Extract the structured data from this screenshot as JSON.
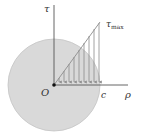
{
  "diagram": {
    "labels": {
      "tau_axis": "τ",
      "tau_max": "τ",
      "tau_max_sub": "max",
      "origin": "O",
      "radius": "c",
      "rho_axis": "ρ"
    },
    "colors": {
      "disk_fill": "#d9d9d9",
      "disk_stroke": "#bdbdbd",
      "axis": "#555555",
      "arrows": "#8c8c8c"
    }
  }
}
